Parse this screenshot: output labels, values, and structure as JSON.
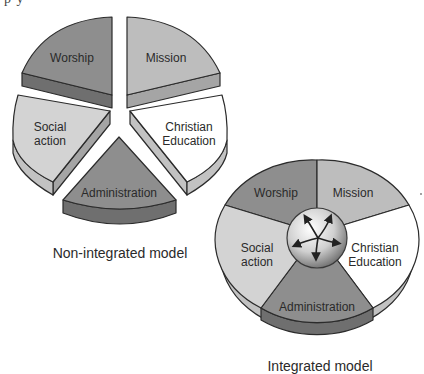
{
  "page": {
    "top_fragment": "p          y"
  },
  "non_integrated": {
    "caption": "Non-integrated model",
    "segments": [
      {
        "label": "Worship",
        "color": "#8e8e8e"
      },
      {
        "label": "Mission",
        "color": "#bdbdbd"
      },
      {
        "label": "Christian",
        "label2": "Education",
        "color": "#ffffff"
      },
      {
        "label": "Administration",
        "color": "#8e8e8e"
      },
      {
        "label": "Social",
        "label2": "action",
        "color": "#d3d3d3"
      }
    ]
  },
  "integrated": {
    "caption": "Integrated model",
    "hub_icon": "circular-arrows-icon",
    "segments": [
      {
        "label": "Worship",
        "color": "#8e8e8e"
      },
      {
        "label": "Mission",
        "color": "#bdbdbd"
      },
      {
        "label": "Christian",
        "label2": "Education",
        "color": "#ffffff"
      },
      {
        "label": "Administration",
        "color": "#8e8e8e"
      },
      {
        "label": "Social",
        "label2": "action",
        "color": "#d3d3d3"
      }
    ]
  },
  "colors": {
    "outline": "#2b2b2b",
    "dark_side": "#6f6f6f",
    "mid_side": "#a5a5a5",
    "light_side": "#c2c2c2"
  }
}
